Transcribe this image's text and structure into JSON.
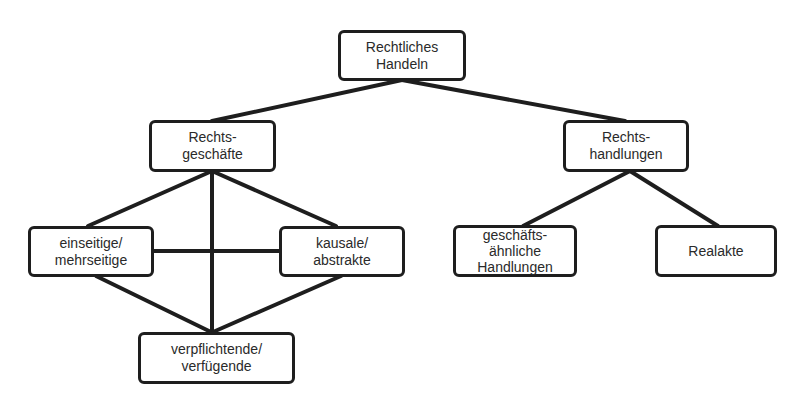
{
  "diagram": {
    "type": "hierarchy",
    "colors": {
      "line": "#1e1e1e",
      "text": "#2a2a2a",
      "background": "#ffffff"
    },
    "nodes": {
      "root": {
        "label": "Rechtliches\nHandeln"
      },
      "rechtsgeschaefte": {
        "label": "Rechts-\ngeschäfte"
      },
      "rechtshandlungen": {
        "label": "Rechts-\nhandlungen"
      },
      "einseitige": {
        "label": "einseitige/\nmehrseitige"
      },
      "kausale": {
        "label": "kausale/\nabstrakte"
      },
      "verpflichtende": {
        "label": "verpflichtende/\nverfügende"
      },
      "geschaeftsaehnliche": {
        "label": "geschäfts-\nähnliche\nHandlungen"
      },
      "realakte": {
        "label": "Realakte"
      }
    },
    "edges": [
      [
        "root",
        "rechtsgeschaefte"
      ],
      [
        "root",
        "rechtshandlungen"
      ],
      [
        "rechtsgeschaefte",
        "einseitige"
      ],
      [
        "rechtsgeschaefte",
        "kausale"
      ],
      [
        "rechtsgeschaefte",
        "verpflichtende"
      ],
      [
        "einseitige",
        "kausale"
      ],
      [
        "einseitige",
        "verpflichtende"
      ],
      [
        "kausale",
        "verpflichtende"
      ],
      [
        "rechtshandlungen",
        "geschaeftsaehnliche"
      ],
      [
        "rechtshandlungen",
        "realakte"
      ]
    ]
  }
}
